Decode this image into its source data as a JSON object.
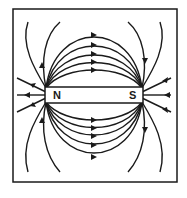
{
  "diagram": {
    "magnet": {
      "north_label": "N",
      "south_label": "S"
    },
    "colors": {
      "line": "#1a1a1a",
      "background": "#ffffff"
    }
  }
}
